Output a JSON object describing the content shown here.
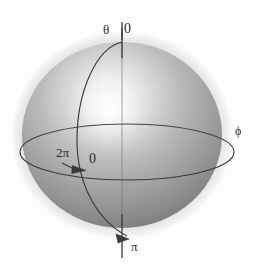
{
  "figure": {
    "background_color": "#fdfdfd",
    "width": 257,
    "height": 271
  },
  "sphere": {
    "name": "shaded-sphere",
    "center_x": 122,
    "center_y": 135,
    "radius_x": 100,
    "radius_y": 93,
    "halo_radius_x": 111,
    "halo_radius_y": 104,
    "halo_color": "#e2e2e2",
    "base_color": "#9d9d9d",
    "shadow_color": "#707070",
    "highlight_color": "#fbfbfb",
    "highlight_x": 110,
    "highlight_y": 113
  },
  "axis": {
    "name": "polar-axis",
    "color": "#3a3a3a",
    "top_y": 28,
    "bottom_y": 258,
    "x": 122
  },
  "equator": {
    "name": "equator-ellipse",
    "color": "#3a3a3a",
    "center_x": 127,
    "center_y": 152,
    "radius_x": 107,
    "radius_y": 28
  },
  "meridian": {
    "name": "meridian-arc",
    "color": "#3a3a3a"
  },
  "labels": {
    "theta": "θ",
    "zero_top": "0",
    "phi": "ϕ",
    "two_pi": "2π",
    "zero_equator": "0",
    "pi": "π"
  },
  "colors": {
    "ink": "#2b2b2b",
    "line": "#3a3a3a",
    "halo": "#e2e2e2",
    "sphere_light": "#cfcfcf",
    "sphere_mid": "#a0a0a0",
    "sphere_dark": "#6e6e6e",
    "background": "#fdfdfd"
  }
}
